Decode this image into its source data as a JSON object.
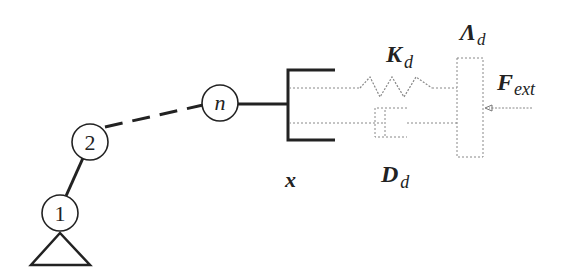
{
  "diagram": {
    "type": "robot-impedance-control-schematic",
    "nodes": [
      {
        "id": "joint-1",
        "label": "1",
        "cx": 60,
        "cy": 213
      },
      {
        "id": "joint-2",
        "label": "2",
        "cx": 90,
        "cy": 142
      },
      {
        "id": "joint-n",
        "label": "n",
        "cx": 220,
        "cy": 103
      }
    ],
    "labels": {
      "position": "x",
      "stiffness_main": "K",
      "stiffness_sub": "d",
      "damping_main": "D",
      "damping_sub": "d",
      "inertia_main": "Λ",
      "inertia_sub": "d",
      "force_main": "F",
      "force_sub": "ext"
    },
    "colors": {
      "stroke": "#222222",
      "dotted": "#888888"
    }
  }
}
